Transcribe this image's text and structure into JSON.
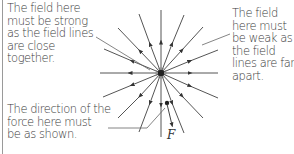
{
  "annotations": {
    "strong_field": [
      "The field here",
      "must be strong",
      "as the field lines",
      "are close",
      "together."
    ],
    "weak_field": [
      "The field",
      "here must",
      "be weak as",
      "the field",
      "lines are far",
      "apart."
    ],
    "force_direction": [
      "The direction of the",
      "force here must",
      "be as shown."
    ]
  },
  "force_symbol": "F",
  "diagram": {
    "type": "radial electric field lines (outward) around a point charge",
    "center": [
      161,
      73
    ],
    "field_line_count": 16,
    "arrow_direction": "outward",
    "line_color": "#444444"
  }
}
